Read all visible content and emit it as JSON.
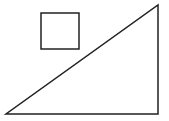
{
  "diagram": {
    "background": "#ffffff",
    "stroke_color": "#222222",
    "stroke_width": 1.5,
    "shapes": [
      {
        "type": "right-triangle",
        "points": [
          [
            6,
            114
          ],
          [
            158,
            114
          ],
          [
            158,
            5
          ]
        ]
      },
      {
        "type": "square",
        "x": 41,
        "y": 13,
        "width": 38,
        "height": 36
      }
    ]
  }
}
